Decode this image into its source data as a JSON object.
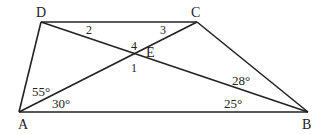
{
  "figure": {
    "type": "geometry-diagram",
    "shape": "trapezoid",
    "vertices": {
      "A": {
        "label": "A",
        "x": 19,
        "y": 112
      },
      "B": {
        "label": "B",
        "x": 308,
        "y": 112
      },
      "C": {
        "label": "C",
        "x": 197,
        "y": 22
      },
      "D": {
        "label": "D",
        "x": 41,
        "y": 22
      },
      "E": {
        "label": "E",
        "x": 135,
        "y": 53
      }
    },
    "segments": [
      "AB",
      "BC",
      "CD",
      "DA",
      "AC",
      "DB"
    ],
    "angle_labels": {
      "DAC": "55°",
      "CAB": "30°",
      "CBD": "28°",
      "DBA": "25°"
    },
    "numbered_angles": {
      "one": "1",
      "two": "2",
      "three": "3",
      "four": "4"
    },
    "stroke_color": "#222222"
  }
}
